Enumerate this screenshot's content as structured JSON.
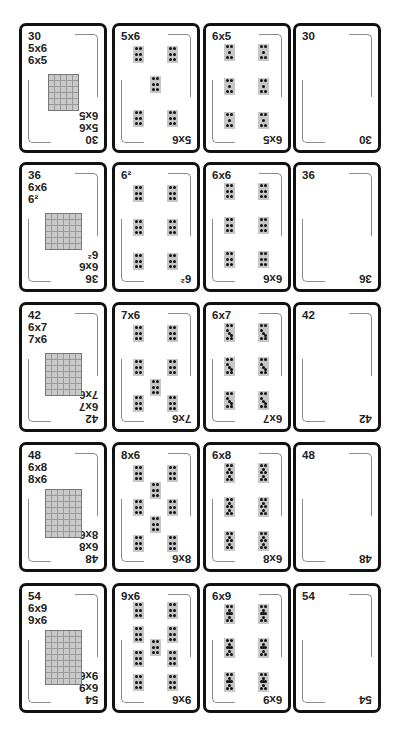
{
  "rows": [
    {
      "product": "30",
      "facts": [
        "5x6",
        "6x5"
      ],
      "grid": {
        "cols": 5,
        "rows": 6
      },
      "pattern_card": {
        "label": "5x6",
        "tiles": 5,
        "dots_per_tile": 6
      },
      "group_card": {
        "label": "6x5",
        "groups": 6,
        "dots_per_group": 5
      }
    },
    {
      "product": "36",
      "facts": [
        "6x6",
        "6²"
      ],
      "grid": {
        "cols": 6,
        "rows": 6
      },
      "pattern_card": {
        "label": "6²",
        "tiles": 6,
        "dots_per_tile": 6
      },
      "group_card": {
        "label": "6x6",
        "groups": 6,
        "dots_per_group": 6
      }
    },
    {
      "product": "42",
      "facts": [
        "6x7",
        "7x6"
      ],
      "grid": {
        "cols": 6,
        "rows": 7
      },
      "pattern_card": {
        "label": "7x6",
        "tiles": 7,
        "dots_per_tile": 6
      },
      "group_card": {
        "label": "6x7",
        "groups": 6,
        "dots_per_group": 7
      }
    },
    {
      "product": "48",
      "facts": [
        "6x8",
        "8x6"
      ],
      "grid": {
        "cols": 6,
        "rows": 8
      },
      "pattern_card": {
        "label": "8x6",
        "tiles": 8,
        "dots_per_tile": 6
      },
      "group_card": {
        "label": "6x8",
        "groups": 6,
        "dots_per_group": 8
      }
    },
    {
      "product": "54",
      "facts": [
        "6x9",
        "9x6"
      ],
      "grid": {
        "cols": 6,
        "rows": 9
      },
      "pattern_card": {
        "label": "9x6",
        "tiles": 9,
        "dots_per_tile": 6
      },
      "group_card": {
        "label": "6x9",
        "groups": 6,
        "dots_per_group": 9
      }
    }
  ],
  "colors": {
    "border": "#111111",
    "tile": "#c7c7c7",
    "dot": "#111111",
    "frame": "#8a8a8a"
  }
}
